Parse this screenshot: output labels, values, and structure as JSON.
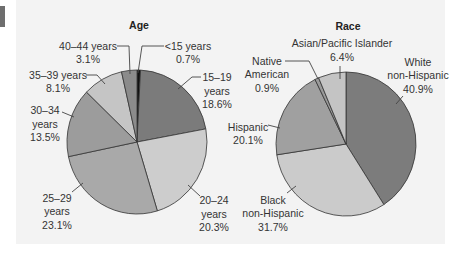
{
  "figure": {
    "background": "#f3f3f3",
    "marker_color": "#6e6e6e",
    "outline_color": "#333333"
  },
  "chart_data": [
    {
      "type": "pie",
      "title": "Age",
      "start_angle_deg": 0,
      "direction": "clockwise",
      "normalized": true,
      "slices": [
        {
          "label": "<15 years",
          "label_lines": [
            "<15 years"
          ],
          "value": 0.7,
          "display": "0.7%",
          "color": "#111111"
        },
        {
          "label": "15–19 years",
          "label_lines": [
            "15–19",
            "years"
          ],
          "value": 18.6,
          "display": "18.6%",
          "color": "#7b7b7b"
        },
        {
          "label": "20–24 years",
          "label_lines": [
            "20–24",
            "years"
          ],
          "value": 20.3,
          "display": "20.3%",
          "color": "#cdcdcd"
        },
        {
          "label": "25–29 years",
          "label_lines": [
            "25–29",
            "years"
          ],
          "value": 23.1,
          "display": "23.1%",
          "color": "#a9a9a9"
        },
        {
          "label": "30–34 years",
          "label_lines": [
            "30–34",
            "years"
          ],
          "value": 13.5,
          "display": "13.5%",
          "color": "#9c9c9c"
        },
        {
          "label": "35–39 years",
          "label_lines": [
            "35–39 years"
          ],
          "value": 8.1,
          "display": "8.1%",
          "color": "#c5c5c5"
        },
        {
          "label": "40–44 years",
          "label_lines": [
            "40–44 years"
          ],
          "value": 3.1,
          "display": "3.1%",
          "color": "#8b8b8b"
        }
      ]
    },
    {
      "type": "pie",
      "title": "Race",
      "start_angle_deg": 0,
      "direction": "clockwise",
      "normalized": true,
      "slices": [
        {
          "label": "White non-Hispanic",
          "label_lines": [
            "White",
            "non-Hispanic"
          ],
          "value": 40.9,
          "display": "40.9%",
          "color": "#7c7c7c"
        },
        {
          "label": "Black non-Hispanic",
          "label_lines": [
            "Black",
            "non-Hispanic"
          ],
          "value": 31.7,
          "display": "31.7%",
          "color": "#cbcbcb"
        },
        {
          "label": "Hispanic",
          "label_lines": [
            "Hispanic"
          ],
          "value": 20.1,
          "display": "20.1%",
          "color": "#a0a0a0"
        },
        {
          "label": "Native American",
          "label_lines": [
            "Native",
            "American"
          ],
          "value": 0.9,
          "display": "0.9%",
          "color": "#9a9a9a"
        },
        {
          "label": "Asian/Pacific Islander",
          "label_lines": [
            "Asian/Pacific Islander"
          ],
          "value": 6.4,
          "display": "6.4%",
          "color": "#c4c4c4"
        }
      ]
    }
  ]
}
